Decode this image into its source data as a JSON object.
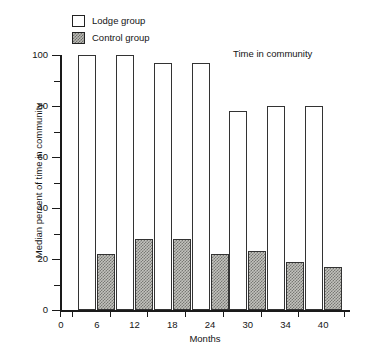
{
  "chart_data": {
    "type": "bar",
    "title": "Time in community",
    "xlabel": "Months",
    "ylabel": "Median percent of time in community",
    "categories": [
      "6",
      "12",
      "18",
      "24",
      "30",
      "34",
      "40"
    ],
    "series": [
      {
        "name": "Lodge group",
        "values": [
          100,
          100,
          97,
          97,
          78,
          80,
          80
        ]
      },
      {
        "name": "Control group",
        "values": [
          22,
          28,
          28,
          22,
          23,
          19,
          17
        ]
      }
    ],
    "ylim": [
      0,
      100
    ],
    "y_major_ticks": [
      0,
      20,
      40,
      60,
      80,
      100
    ],
    "y_minor_ticks": [
      10,
      30,
      50,
      70,
      90
    ],
    "x_tick_labels": [
      "0",
      "6",
      "12",
      "18",
      "24",
      "30",
      "34",
      "40"
    ],
    "grid": false,
    "legend_position": "top-left",
    "colors": {
      "lodge_fill": "#ffffff",
      "control_fill": "#c2c2bd",
      "outline": "#333333",
      "axis": "#1a1a1a",
      "text": "#141414"
    }
  },
  "legend": {
    "items": [
      {
        "label": "Lodge group",
        "swatch": "open-square-swatch"
      },
      {
        "label": "Control group",
        "swatch": "hatched-square-swatch"
      }
    ]
  },
  "annotation": {
    "text": "Time in community"
  },
  "axes": {
    "y_title": "Median percent of time in community",
    "x_title": "Months"
  }
}
